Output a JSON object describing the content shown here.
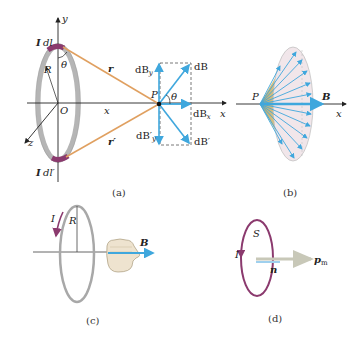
{
  "panels": {
    "a": {
      "caption": "(a)",
      "labels": {
        "y_axis": "y",
        "x_axis": "x",
        "z_axis": "z",
        "origin": "O",
        "radius": "R",
        "theta_top": "θ",
        "current_element_top_I": "I",
        "current_element_top_dl": "dl",
        "current_element_bottom_I": "I",
        "current_element_bottom_dl": "dl′",
        "r": "r",
        "r_prime": "r′",
        "x_distance": "x",
        "point": "P",
        "theta_field": "θ",
        "dBy": "dB",
        "dBy_sub": "y",
        "dBy_prime": "dB′",
        "dBy_prime_sub": "y",
        "dB": "dB",
        "dBx": "dB",
        "dBx_sub": "x",
        "dB_prime": "dB′"
      }
    },
    "b": {
      "caption": "(b)",
      "labels": {
        "point": "P",
        "field": "B",
        "x_axis": "x"
      }
    },
    "c": {
      "caption": "(c)",
      "labels": {
        "current": "I",
        "radius": "R",
        "field": "B"
      }
    },
    "d": {
      "caption": "(d)",
      "labels": {
        "area": "S",
        "current": "I",
        "normal": "n",
        "moment": "p",
        "moment_sub": "m"
      }
    }
  },
  "colors": {
    "ring": "#b5b5b5",
    "ring_dark": "#8a8a8a",
    "current_element": "#8b3a6e",
    "position_vector": "#e0a060",
    "field_vector": "#3fa7dd",
    "axis": "#222222",
    "cone_fill": "#c9b36a",
    "cone_cap": "#f1e6ea",
    "loop_d": "#8b3a6e"
  }
}
